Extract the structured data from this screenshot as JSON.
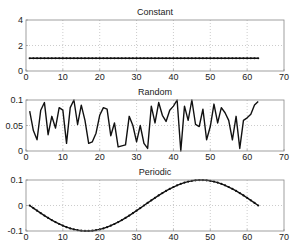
{
  "chart_data": [
    {
      "type": "line",
      "title": "Constant",
      "xlabel": "",
      "ylabel": "",
      "xlim": [
        0,
        70
      ],
      "ylim": [
        0,
        4
      ],
      "xticks": [
        0,
        10,
        20,
        30,
        40,
        50,
        60,
        70
      ],
      "yticks": [
        0,
        2,
        4
      ],
      "grid": true,
      "marker": "dot",
      "x_start": 1,
      "x_end": 63,
      "values": [
        1,
        1,
        1,
        1,
        1,
        1,
        1,
        1,
        1,
        1,
        1,
        1,
        1,
        1,
        1,
        1,
        1,
        1,
        1,
        1,
        1,
        1,
        1,
        1,
        1,
        1,
        1,
        1,
        1,
        1,
        1,
        1,
        1,
        1,
        1,
        1,
        1,
        1,
        1,
        1,
        1,
        1,
        1,
        1,
        1,
        1,
        1,
        1,
        1,
        1,
        1,
        1,
        1,
        1,
        1,
        1,
        1,
        1,
        1,
        1,
        1,
        1,
        1
      ]
    },
    {
      "type": "line",
      "title": "Random",
      "xlabel": "",
      "ylabel": "",
      "xlim": [
        0,
        70
      ],
      "ylim": [
        0,
        0.1
      ],
      "xticks": [
        0,
        10,
        20,
        30,
        40,
        50,
        60,
        70
      ],
      "yticks": [
        0,
        0.05,
        0.1
      ],
      "grid": true,
      "x_start": 1,
      "x_end": 63,
      "values": [
        0.078,
        0.04,
        0.022,
        0.08,
        0.095,
        0.032,
        0.068,
        0.045,
        0.085,
        0.08,
        0.015,
        0.085,
        0.1,
        0.052,
        0.09,
        0.06,
        0.015,
        0.018,
        0.035,
        0.07,
        0.085,
        0.082,
        0.03,
        0.055,
        0.008,
        0.01,
        0.012,
        0.068,
        0.05,
        0.018,
        0.05,
        0.015,
        0.005,
        0.088,
        0.055,
        0.095,
        0.07,
        0.058,
        0.08,
        0.088,
        0.1,
        0.0,
        0.088,
        0.06,
        0.1,
        0.052,
        0.048,
        0.082,
        0.022,
        0.048,
        0.092,
        0.055,
        0.085,
        0.075,
        0.06,
        0.022,
        0.068,
        0.005,
        0.06,
        0.065,
        0.072,
        0.09,
        0.097
      ]
    },
    {
      "type": "line",
      "title": "Periodic",
      "xlabel": "",
      "ylabel": "",
      "xlim": [
        0,
        70
      ],
      "ylim": [
        -0.1,
        0.1
      ],
      "xticks": [
        0,
        10,
        20,
        30,
        40,
        50,
        60,
        70
      ],
      "yticks": [
        -0.1,
        0,
        0.1
      ],
      "grid": true,
      "marker": "dot",
      "x_start": 1,
      "x_end": 63,
      "formula": "-0.1*sin(2*pi*(x-1)/62)"
    }
  ],
  "style": {
    "line_color": "#111111",
    "axis_color": "#888888",
    "grid_color": "#aaaaaa"
  },
  "layout": {
    "axes": [
      {
        "left": 26,
        "right": 284,
        "top": 20,
        "bottom": 71,
        "title_y": 12
      },
      {
        "left": 26,
        "right": 284,
        "top": 100,
        "bottom": 151,
        "title_y": 92
      },
      {
        "left": 26,
        "right": 284,
        "top": 180,
        "bottom": 231,
        "title_y": 172
      }
    ]
  }
}
